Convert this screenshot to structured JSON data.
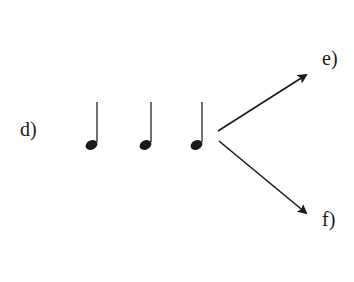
{
  "diagram": {
    "labels": {
      "d": "d)",
      "e": "e)",
      "f": "f)"
    },
    "notes": [
      {
        "type": "quarter-note",
        "stem": "up"
      },
      {
        "type": "quarter-note",
        "stem": "up"
      },
      {
        "type": "quarter-note",
        "stem": "up"
      }
    ],
    "arrows": [
      {
        "direction": "up-right",
        "target": "e)"
      },
      {
        "direction": "down-right",
        "target": "f)"
      }
    ],
    "colors": {
      "ink": "#1a1a1a",
      "background": "#ffffff"
    }
  }
}
